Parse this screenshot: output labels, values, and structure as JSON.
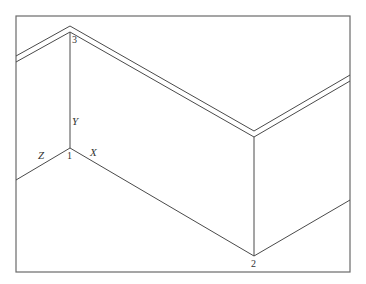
{
  "diagram": {
    "type": "isometric-axes-with-sloped-frame",
    "colors": {
      "line": "#4a4a4a",
      "frame": "#6a6a6a",
      "text": "#333333",
      "background": "#ffffff"
    },
    "axis_labels": {
      "x": "X",
      "y": "Y",
      "z": "Z"
    },
    "vertex_labels": {
      "v1": "1",
      "v2": "2",
      "v3": "3"
    },
    "frame": {
      "x": 16,
      "y": 16,
      "width": 334,
      "height": 256
    },
    "points": {
      "v1": [
        70,
        148
      ],
      "v2": [
        254,
        256
      ],
      "v3": [
        70,
        30
      ],
      "v2_top": [
        254,
        136
      ],
      "z_end": [
        16,
        180
      ],
      "right_end": [
        350,
        200
      ]
    }
  }
}
